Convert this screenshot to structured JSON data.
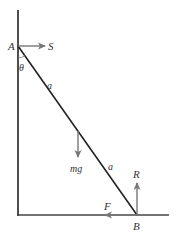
{
  "diagram": {
    "labels": {
      "point_top": "A",
      "point_bottom": "B",
      "angle": "θ",
      "segment_upper": "a",
      "segment_lower": "a",
      "force_wall": "S",
      "force_weight": "mg",
      "force_normal": "R",
      "force_friction": "F"
    },
    "colors": {
      "structure": "#222222",
      "force_arrow": "#777777",
      "text": "#333333"
    }
  }
}
